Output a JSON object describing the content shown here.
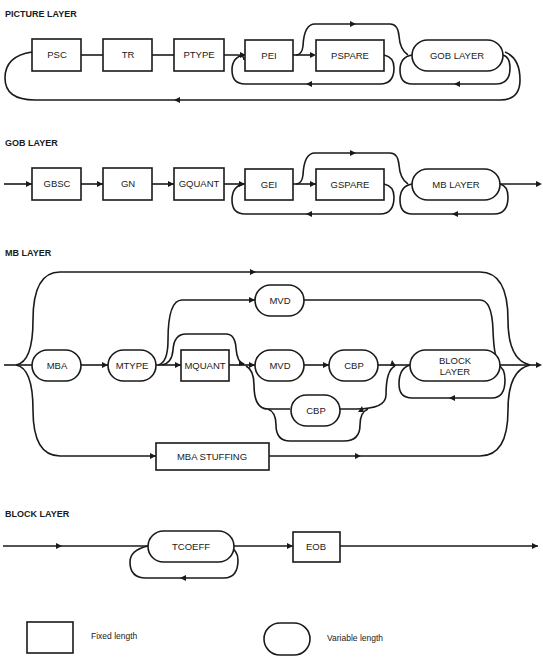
{
  "sections": {
    "picture": {
      "title": "PICTURE LAYER",
      "nodes": {
        "psc": "PSC",
        "tr": "TR",
        "ptype": "PTYPE",
        "pei": "PEI",
        "pspare": "PSPARE",
        "gob_layer": "GOB LAYER"
      }
    },
    "gob": {
      "title": "GOB LAYER",
      "nodes": {
        "gbsc": "GBSC",
        "gn": "GN",
        "gquant": "GQUANT",
        "gei": "GEI",
        "gspare": "GSPARE",
        "mb_layer": "MB LAYER"
      }
    },
    "mb": {
      "title": "MB LAYER",
      "nodes": {
        "mba": "MBA",
        "mtype": "MTYPE",
        "mquant": "MQUANT",
        "mvd_top": "MVD",
        "mvd_mid": "MVD",
        "cbp_mid": "CBP",
        "cbp_low": "CBP",
        "block_layer_1": "BLOCK",
        "block_layer_2": "LAYER",
        "mba_stuffing": "MBA STUFFING"
      }
    },
    "block": {
      "title": "BLOCK LAYER",
      "nodes": {
        "tcoeff": "TCOEFF",
        "eob": "EOB"
      }
    }
  },
  "legend": {
    "fixed": "Fixed length",
    "variable": "Variable length"
  }
}
